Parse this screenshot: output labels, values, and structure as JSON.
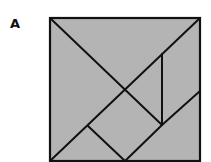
{
  "figure": {
    "label": "A",
    "type": "tangram",
    "fill_color": "#b4b4b4",
    "stroke_color": "#111111",
    "square": {
      "x1": 50,
      "y1": 18,
      "x2": 200,
      "y2": 161
    },
    "pieces": [
      {
        "name": "large-triangle-left",
        "points": "50,18 125,90 50,161"
      },
      {
        "name": "large-triangle-top",
        "points": "50,18 200,18 125,90"
      },
      {
        "name": "small-triangle-center",
        "points": "125,90 162,54 162,125"
      },
      {
        "name": "parallelogram-right",
        "points": "162,54 200,18 200,91 162,125"
      },
      {
        "name": "square-center",
        "points": "125,90 162,125 125,161 88,126"
      },
      {
        "name": "small-triangle-bottom",
        "points": "50,161 88,126 125,161"
      },
      {
        "name": "medium-triangle-bottom-right",
        "points": "125,161 200,91 200,161"
      }
    ]
  }
}
